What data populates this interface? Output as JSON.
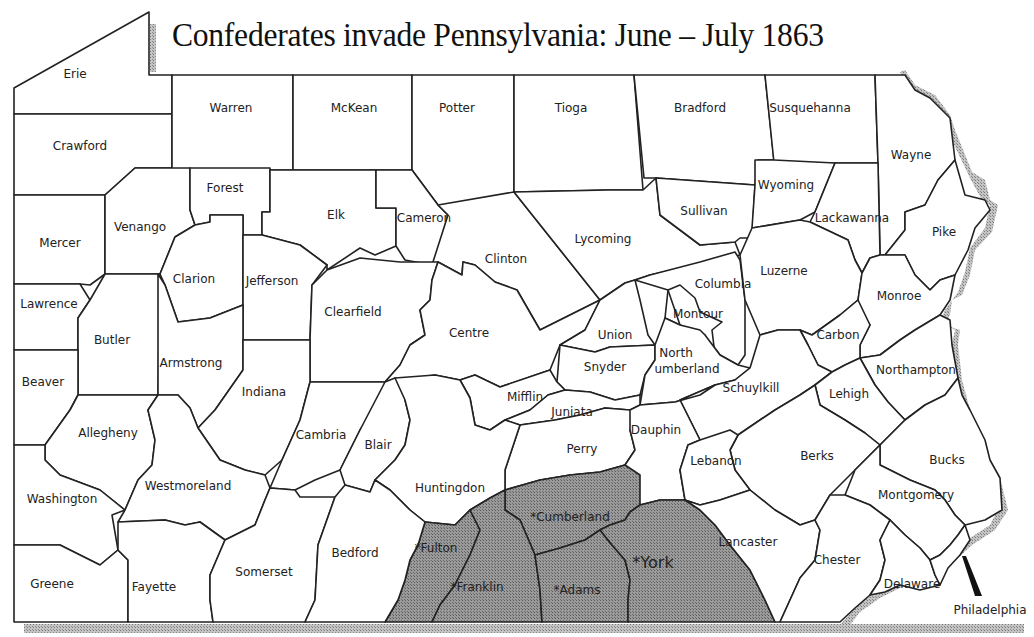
{
  "title": "Confederates invade Pennsylvania: June – July 1863",
  "colors": {
    "county_fill": "#ffffff",
    "invaded_fill": "#8c8c8c",
    "border": "#222222",
    "shadow": "#a0a0a0"
  },
  "legend_note": "* indicates county invaded by Confederates",
  "counties": {
    "erie": "Erie",
    "crawford": "Crawford",
    "warren": "Warren",
    "mckean": "McKean",
    "potter": "Potter",
    "tioga": "Tioga",
    "bradford": "Bradford",
    "susquehanna": "Susquehanna",
    "wayne": "Wayne",
    "mercer": "Mercer",
    "venango": "Venango",
    "forest": "Forest",
    "elk": "Elk",
    "cameron": "Cameron",
    "clinton": "Clinton",
    "lycoming": "Lycoming",
    "sullivan": "Sullivan",
    "wyoming": "Wyoming",
    "lackawanna": "Lackawanna",
    "pike": "Pike",
    "lawrence": "Lawrence",
    "clarion": "Clarion",
    "jefferson": "Jefferson",
    "clearfield": "Clearfield",
    "centre": "Centre",
    "union": "Union",
    "columbia": "Columbia",
    "montour": "Montour",
    "luzerne": "Luzerne",
    "monroe": "Monroe",
    "butler": "Butler",
    "armstrong": "Armstrong",
    "snyder": "Snyder",
    "northumberland_1": "North",
    "northumberland_2": "umberland",
    "carbon": "Carbon",
    "beaver": "Beaver",
    "indiana": "Indiana",
    "mifflin": "Mifflin",
    "schuylkill": "Schuylkill",
    "northampton": "Northampton",
    "lehigh": "Lehigh",
    "allegheny": "Allegheny",
    "juniata": "Juniata",
    "cambria": "Cambria",
    "blair": "Blair",
    "perry": "Perry",
    "dauphin": "Dauphin",
    "berks": "Berks",
    "bucks": "Bucks",
    "lebanon": "Lebanon",
    "washington": "Washington",
    "westmoreland": "Westmoreland",
    "huntingdon": "Huntingdon",
    "montgomery": "Montgomery",
    "cumberland": "*Cumberland",
    "fulton": "*Fulton",
    "lancaster": "Lancaster",
    "york": "*York",
    "bedford": "Bedford",
    "somerset": "Somerset",
    "chester": "Chester",
    "delaware": "Delaware",
    "greene": "Greene",
    "fayette": "Fayette",
    "franklin": "*Franklin",
    "adams": "*Adams",
    "philadelphia": "Philadelphia"
  },
  "invaded_counties": [
    "Fulton",
    "Franklin",
    "Cumberland",
    "Adams",
    "York"
  ]
}
